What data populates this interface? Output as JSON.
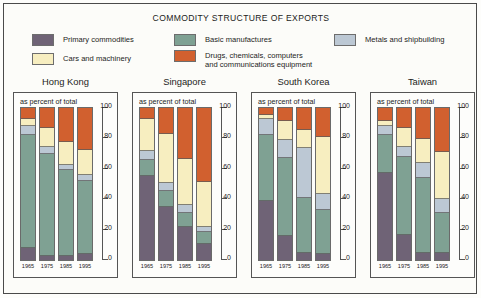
{
  "title": "COMMODITY STRUCTURE OF EXPORTS",
  "subcaption": "as percent of total",
  "legend": [
    {
      "key": "primary",
      "label": "Primary commodities",
      "color": "#6f6376"
    },
    {
      "key": "cars",
      "label": "Cars and machinery",
      "color": "#f7eec0"
    },
    {
      "key": "basic",
      "label": "Basic manufactures",
      "color": "#7fa193"
    },
    {
      "key": "drugs",
      "label": "Drugs, chemicals, computers\nand communications equipment",
      "color": "#d1602f"
    },
    {
      "key": "metals",
      "label": "Metals and shipbuilding",
      "color": "#bcc8d4"
    }
  ],
  "axis": {
    "ticks": [
      "0",
      "20",
      "40",
      "60",
      "80",
      "100"
    ],
    "min": 0,
    "max": 100
  },
  "years": [
    "1965",
    "1975",
    "1985",
    "1995"
  ],
  "chart_data": {
    "type": "bar",
    "title": "COMMODITY STRUCTURE OF EXPORTS",
    "subtitle": "as percent of total",
    "xlabel": "",
    "ylabel": "percent of total",
    "ylim": [
      0,
      100
    ],
    "grid": false,
    "legend_position": "top",
    "stacked": true,
    "categories": [
      "1965",
      "1975",
      "1985",
      "1995"
    ],
    "series_order": [
      "primary",
      "basic",
      "metals",
      "cars",
      "drugs"
    ],
    "series_labels": {
      "primary": "Primary commodities",
      "basic": "Basic manufactures",
      "metals": "Metals and shipbuilding",
      "cars": "Cars and machinery",
      "drugs": "Drugs, chemicals, computers and communications equipment"
    },
    "panels": [
      {
        "name": "Hong Kong",
        "bars": [
          {
            "year": "1965",
            "primary": 8,
            "basic": 76,
            "metals": 5,
            "cars": 4,
            "drugs": 7
          },
          {
            "year": "1975",
            "primary": 3,
            "basic": 68,
            "metals": 4,
            "cars": 12,
            "drugs": 13
          },
          {
            "year": "1985",
            "primary": 3,
            "basic": 57,
            "metals": 3,
            "cars": 15,
            "drugs": 22
          },
          {
            "year": "1995",
            "primary": 4,
            "basic": 49,
            "metals": 3,
            "cars": 16,
            "drugs": 28
          }
        ]
      },
      {
        "name": "Singapore",
        "bars": [
          {
            "year": "1965",
            "primary": 57,
            "basic": 10,
            "metals": 5,
            "cars": 21,
            "drugs": 7
          },
          {
            "year": "1975",
            "primary": 36,
            "basic": 10,
            "metals": 5,
            "cars": 32,
            "drugs": 17
          },
          {
            "year": "1985",
            "primary": 22,
            "basic": 9,
            "metals": 5,
            "cars": 30,
            "drugs": 34
          },
          {
            "year": "1995",
            "primary": 11,
            "basic": 7,
            "metals": 3,
            "cars": 30,
            "drugs": 49
          }
        ]
      },
      {
        "name": "South Korea",
        "bars": [
          {
            "year": "1965",
            "primary": 40,
            "basic": 44,
            "metals": 10,
            "cars": 2,
            "drugs": 4
          },
          {
            "year": "1975",
            "primary": 16,
            "basic": 52,
            "metals": 12,
            "cars": 12,
            "drugs": 8
          },
          {
            "year": "1985",
            "primary": 5,
            "basic": 36,
            "metals": 33,
            "cars": 12,
            "drugs": 14
          },
          {
            "year": "1995",
            "primary": 4,
            "basic": 29,
            "metals": 10,
            "cars": 38,
            "drugs": 19
          }
        ]
      },
      {
        "name": "Taiwan",
        "bars": [
          {
            "year": "1965",
            "primary": 59,
            "basic": 25,
            "metals": 5,
            "cars": 3,
            "drugs": 8
          },
          {
            "year": "1975",
            "primary": 17,
            "basic": 52,
            "metals": 6,
            "cars": 12,
            "drugs": 13
          },
          {
            "year": "1985",
            "primary": 5,
            "basic": 50,
            "metals": 9,
            "cars": 16,
            "drugs": 20
          },
          {
            "year": "1995",
            "primary": 5,
            "basic": 26,
            "metals": 9,
            "cars": 31,
            "drugs": 29
          }
        ]
      }
    ]
  }
}
